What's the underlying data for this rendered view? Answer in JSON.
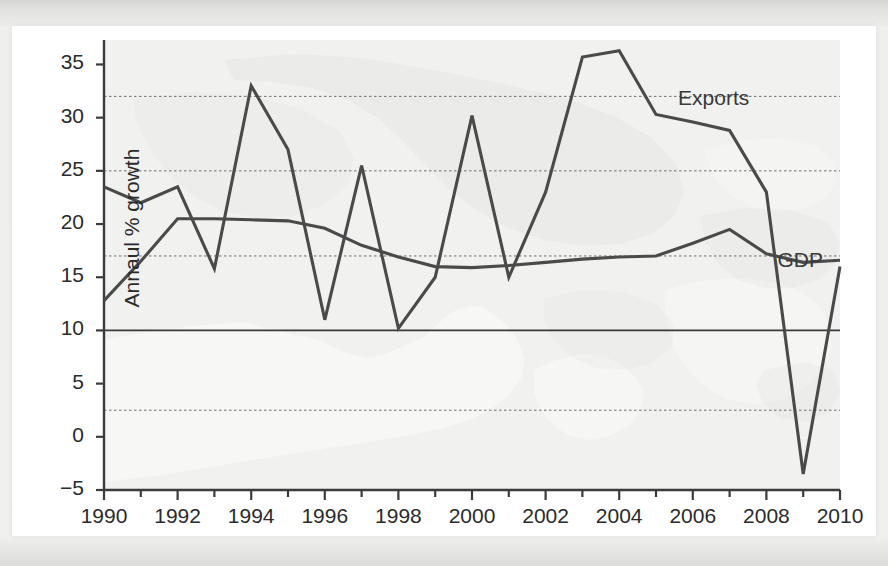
{
  "chart_data": {
    "type": "line",
    "title": "",
    "xlabel": "",
    "ylabel": "Annaul % growth",
    "x": [
      1990,
      1991,
      1992,
      1993,
      1994,
      1995,
      1996,
      1997,
      1998,
      1999,
      2000,
      2001,
      2002,
      2003,
      2004,
      2005,
      2006,
      2007,
      2008,
      2009,
      2010
    ],
    "xlim": [
      1990,
      2010
    ],
    "ylim": [
      -5,
      37.3
    ],
    "yticks": [
      -5,
      0,
      5,
      10,
      15,
      20,
      25,
      30,
      35
    ],
    "ytick_labels": [
      "−5",
      "0",
      "5",
      "10",
      "15",
      "20",
      "25",
      "30",
      "35"
    ],
    "xticks": [
      1990,
      1991,
      1992,
      1993,
      1994,
      1995,
      1996,
      1997,
      1998,
      1999,
      2000,
      2001,
      2002,
      2003,
      2004,
      2005,
      2006,
      2007,
      2008,
      2009,
      2010
    ],
    "xtick_labels": [
      "1990",
      "",
      "1992",
      "",
      "1994",
      "",
      "1996",
      "",
      "1998",
      "",
      "2000",
      "",
      "2002",
      "",
      "2004",
      "",
      "2006",
      "",
      "2008",
      "",
      "2010"
    ],
    "gridlines_dashed": [
      2.5,
      17.0,
      25.0,
      32.0
    ],
    "gridlines_solid": [
      10.0
    ],
    "grid": true,
    "legend_position": "inline-annotation",
    "series": [
      {
        "name": "Exports",
        "label_x": 2005.6,
        "label_y": 31.6,
        "color": "#4a4a4a",
        "values": [
          23.5,
          22.0,
          23.5,
          15.8,
          33.0,
          27.0,
          11.0,
          25.5,
          10.2,
          15.0,
          30.2,
          15.0,
          23.0,
          35.7,
          36.3,
          30.3,
          29.6,
          28.8,
          23.0,
          -3.5,
          16.0
        ]
      },
      {
        "name": "GDP",
        "label_x": 2008.3,
        "label_y": 16.3,
        "color": "#4a4a4a",
        "values": [
          12.8,
          16.5,
          20.5,
          20.5,
          20.4,
          20.3,
          19.6,
          18.0,
          16.9,
          16.0,
          15.9,
          16.1,
          16.4,
          16.7,
          16.9,
          17.0,
          18.2,
          19.5,
          17.2,
          16.4,
          16.6
        ]
      }
    ]
  },
  "annotations": {
    "exports_label": "Exports",
    "gdp_label": "GDP"
  }
}
